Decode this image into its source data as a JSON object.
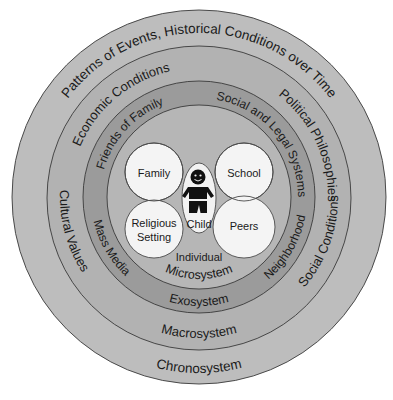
{
  "diagram": {
    "colors": {
      "chrono": "#bdbdbd",
      "macro": "#b2b2b2",
      "exo": "#9b9b9b",
      "micro": "#b6b6b6",
      "center_circle": "#f4f4f4"
    },
    "rings": {
      "chronosystem": {
        "name": "Chronosystem",
        "labels": [
          "Patterns of Events, Historical Conditions over Time"
        ]
      },
      "macrosystem": {
        "name": "Macrosystem",
        "labels": [
          "Economic Conditions",
          "Political Philosophies",
          "Cultural Values",
          "Social Conditions"
        ]
      },
      "exosystem": {
        "name": "Exosystem",
        "labels": [
          "Friends of Family",
          "Social and Legal Systems",
          "Mass Media",
          "Neighborhood"
        ]
      },
      "microsystem": {
        "name": "Microsystem",
        "individual_label": "Individual",
        "settings": [
          "Family",
          "School",
          "Religious Setting",
          "Peers"
        ],
        "religious_line1": "Religious",
        "religious_line2": "Setting"
      }
    },
    "child_label": "Child",
    "child_icon": "child-figure-icon"
  }
}
